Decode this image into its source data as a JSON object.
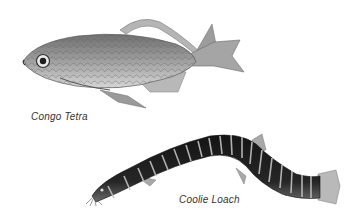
{
  "illustration": {
    "background": "#ffffff",
    "subjects": [
      {
        "name": "Congo Tetra",
        "caption": "Congo Tetra",
        "tone": "silver-gray scaled body with long trailing fins"
      },
      {
        "name": "Coolie Loach",
        "caption": "Coolie Loach",
        "tone": "dark eel-like body with pale vertical bands"
      }
    ]
  },
  "colors": {
    "tetra_body": "#8e8e8e",
    "tetra_belly": "#cfcfcf",
    "tetra_fin": "#a8a8a8",
    "loach_body": "#1e1e1e",
    "loach_band": "#bdbdbd",
    "caption_text": "#333333"
  }
}
